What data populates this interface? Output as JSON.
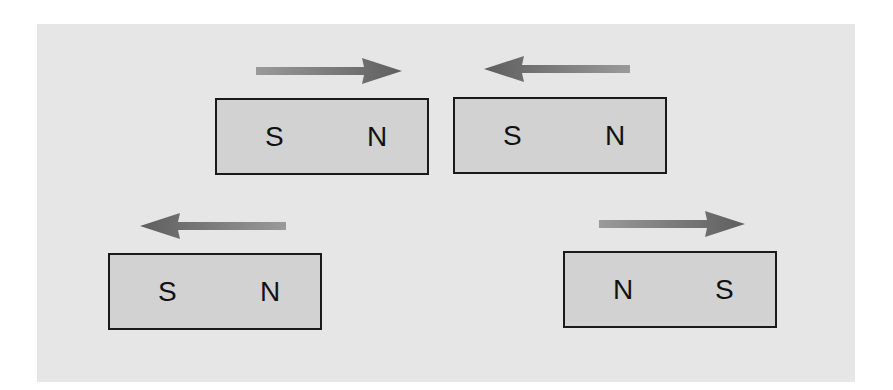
{
  "diagram": {
    "colors": {
      "background": "#e6e6e6",
      "magnet_fill": "#d2d2d2",
      "magnet_border": "#1a1a1a",
      "arrow": "#6f6f6f"
    },
    "magnets": [
      {
        "id": "top-left",
        "left_pole": "S",
        "right_pole": "N",
        "arrow_direction": "right"
      },
      {
        "id": "top-right",
        "left_pole": "S",
        "right_pole": "N",
        "arrow_direction": "left"
      },
      {
        "id": "bottom-left",
        "left_pole": "S",
        "right_pole": "N",
        "arrow_direction": "left"
      },
      {
        "id": "bottom-right",
        "left_pole": "N",
        "right_pole": "S",
        "arrow_direction": "right"
      }
    ]
  }
}
